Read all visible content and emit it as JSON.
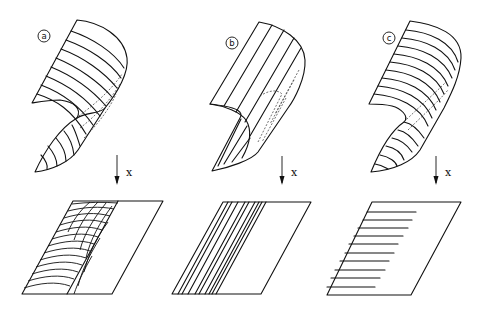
{
  "figure": {
    "panels": [
      {
        "id": "a",
        "label": "a",
        "axis_label": "x",
        "top_pattern": "oblique curved lines",
        "projection_pattern": "overlapping arcs along left band"
      },
      {
        "id": "b",
        "label": "b",
        "axis_label": "x",
        "top_pattern": "straight generator lines parallel to axis",
        "projection_pattern": "parallel slanted lines"
      },
      {
        "id": "c",
        "label": "c",
        "axis_label": "x",
        "top_pattern": "horizontal circular sections",
        "projection_pattern": "horizontal lines from left edge"
      }
    ]
  }
}
